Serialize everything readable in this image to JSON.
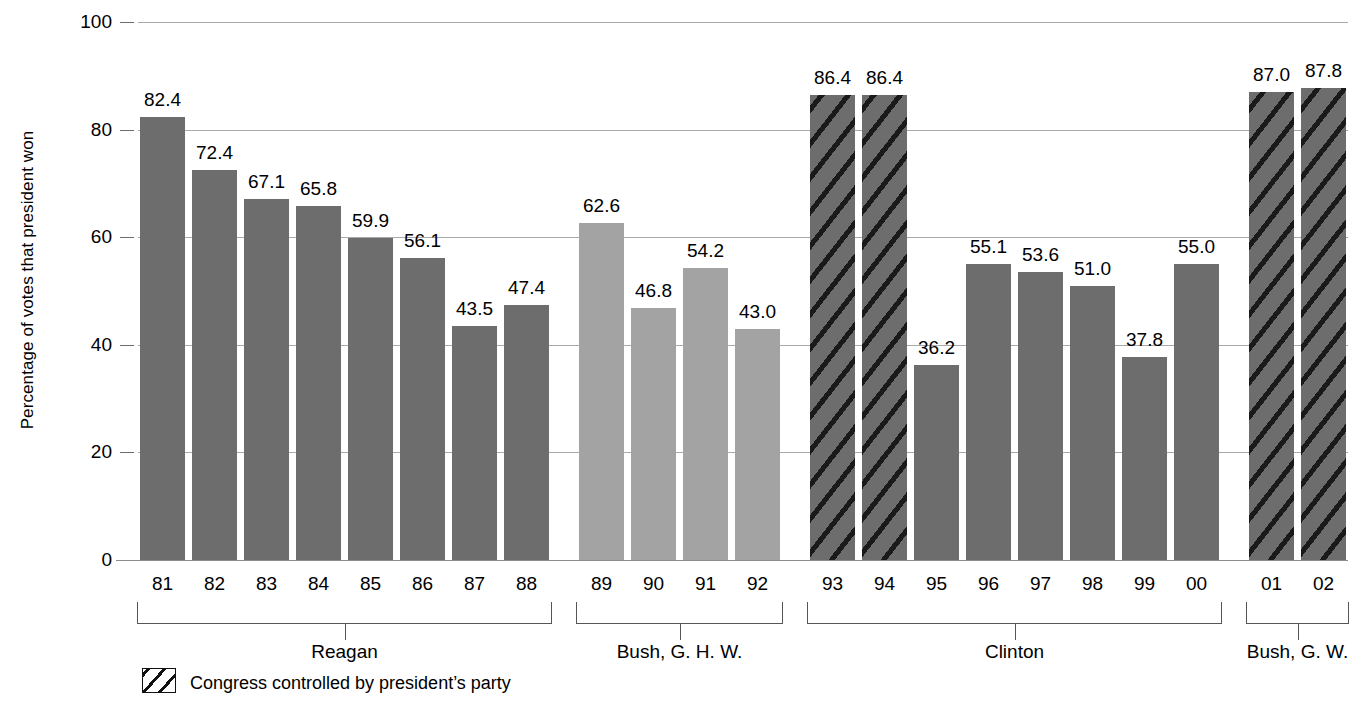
{
  "chart_data": {
    "type": "bar",
    "title": "",
    "xlabel": "",
    "ylabel": "Percentage of votes that president won",
    "ylim": [
      0,
      100
    ],
    "yticks": [
      "0",
      "20",
      "40",
      "60",
      "80",
      "100"
    ],
    "grid": true,
    "legend_position": "bottom-left",
    "legend": [
      {
        "key": "hatched",
        "label": "Congress controlled by president’s party"
      }
    ],
    "categories": [
      "81",
      "82",
      "83",
      "84",
      "85",
      "86",
      "87",
      "88",
      "89",
      "90",
      "91",
      "92",
      "93",
      "94",
      "95",
      "96",
      "97",
      "98",
      "99",
      "00",
      "01",
      "02"
    ],
    "values": [
      82.4,
      72.4,
      67.1,
      65.8,
      59.9,
      56.1,
      43.5,
      47.4,
      62.6,
      46.8,
      54.2,
      43.0,
      86.4,
      86.4,
      36.2,
      55.1,
      53.6,
      51.0,
      37.8,
      55.0,
      87.0,
      87.8
    ],
    "data_labels": [
      "82.4",
      "72.4",
      "67.1",
      "65.8",
      "59.9",
      "56.1",
      "43.5",
      "47.4",
      "62.6",
      "46.8",
      "54.2",
      "43.0",
      "86.4",
      "86.4",
      "36.2",
      "55.1",
      "53.6",
      "51.0",
      "37.8",
      "55.0",
      "87.0",
      "87.8"
    ],
    "bar_styles": [
      "solid-dark",
      "solid-dark",
      "solid-dark",
      "solid-dark",
      "solid-dark",
      "solid-dark",
      "solid-dark",
      "solid-dark",
      "solid-light",
      "solid-light",
      "solid-light",
      "solid-light",
      "hatched",
      "hatched",
      "solid-dark",
      "solid-dark",
      "solid-dark",
      "solid-dark",
      "solid-dark",
      "solid-dark",
      "hatched",
      "hatched"
    ],
    "groups": [
      {
        "name": "Reagan",
        "categories": [
          "81",
          "82",
          "83",
          "84",
          "85",
          "86",
          "87",
          "88"
        ]
      },
      {
        "name": "Bush, G. H. W.",
        "categories": [
          "89",
          "90",
          "91",
          "92"
        ]
      },
      {
        "name": "Clinton",
        "categories": [
          "93",
          "94",
          "95",
          "96",
          "97",
          "98",
          "99",
          "00"
        ]
      },
      {
        "name": "Bush, G. W.",
        "categories": [
          "01",
          "02"
        ]
      }
    ],
    "colors": {
      "bar_dark": "#6d6d6d",
      "bar_light": "#a3a3a3",
      "hatch_line": "#1a1a1a",
      "gridline": "#a9a9a9",
      "axis": "#8c8c8c",
      "text": "#000000",
      "background": "#ffffff"
    }
  }
}
